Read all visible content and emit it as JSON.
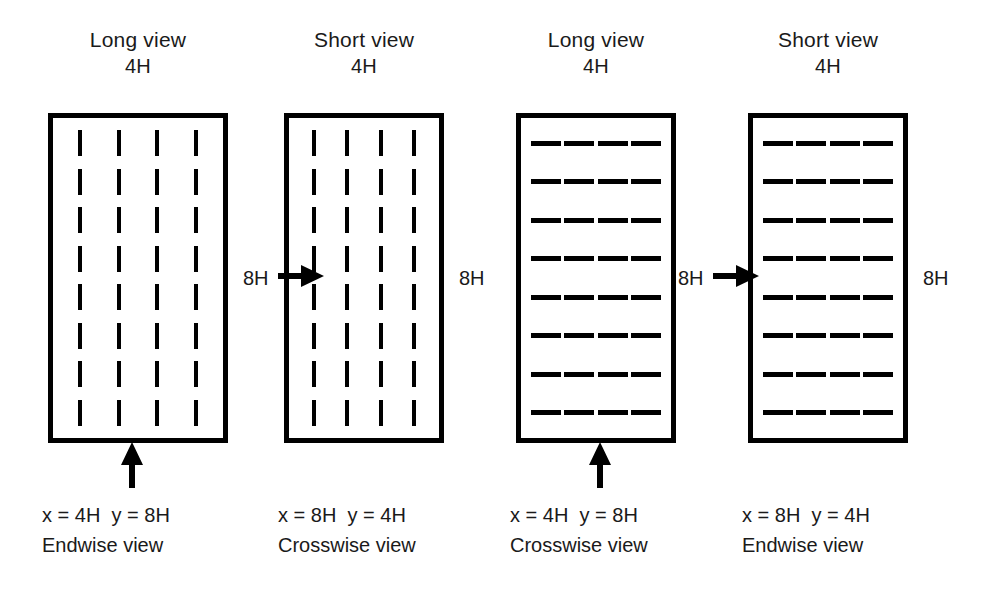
{
  "figure": {
    "panel_width_label": "4H",
    "panel_height_label": "8H",
    "ink_color": "#000000",
    "background_color": "#ffffff",
    "grid_columns": 4,
    "grid_rows": 8
  },
  "panels": [
    {
      "header_title": "Long view",
      "header_dim": "4H",
      "dash_orientation": "vertical",
      "side_dim_label": "8H",
      "arrow_direction": "up",
      "caption_line1": "x = 4H  y = 8H",
      "caption_line2": "Endwise view"
    },
    {
      "header_title": "Short view",
      "header_dim": "4H",
      "dash_orientation": "vertical",
      "side_dim_label": "8H",
      "arrow_direction": "right",
      "caption_line1": "x = 8H  y = 4H",
      "caption_line2": "Crosswise view"
    },
    {
      "header_title": "Long view",
      "header_dim": "4H",
      "dash_orientation": "horizontal",
      "side_dim_label": "8H",
      "arrow_direction": "up",
      "caption_line1": "x = 4H  y = 8H",
      "caption_line2": "Crosswise view"
    },
    {
      "header_title": "Short view",
      "header_dim": "4H",
      "dash_orientation": "horizontal",
      "side_dim_label": "8H",
      "arrow_direction": "right",
      "caption_line1": "x = 8H  y = 4H",
      "caption_line2": "Endwise view"
    }
  ],
  "dimension_labels": {
    "panel1_right": "8H",
    "panel2_left_arrow": "8H",
    "panel2_right": "8H",
    "panel3_left_arrow": "8H",
    "panel4_right": "8H"
  }
}
